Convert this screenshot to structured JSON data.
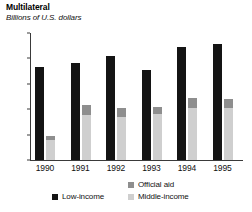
{
  "header": {
    "title": "Multilateral",
    "subtitle": "Billions of U.S. dollars"
  },
  "legend": {
    "official_aid": "Official aid",
    "low_income": "Low-income",
    "middle_income": "Middle-income"
  },
  "colors": {
    "low_income": "#141414",
    "official_aid": "#8e8e8e",
    "middle_income": "#cfcfcf",
    "axis": "#3a3a3a",
    "background": "#ffffff"
  },
  "axis": {
    "y_ticks": [
      "0",
      "3",
      "6",
      "9",
      "12",
      "15"
    ],
    "x_ticks": [
      "1990",
      "1991",
      "1992",
      "1993",
      "1994",
      "1995"
    ]
  },
  "chart_data": {
    "type": "bar",
    "title": "Multilateral",
    "subtitle": "Billions of U.S. dollars",
    "xlabel": "",
    "ylabel": "Billions of U.S. dollars",
    "ylim": [
      0,
      15
    ],
    "yticks": [
      0,
      3,
      6,
      9,
      12,
      15
    ],
    "grid": false,
    "legend_position": "bottom-right",
    "categories": [
      "1990",
      "1991",
      "1992",
      "1993",
      "1994",
      "1995"
    ],
    "series": [
      {
        "name": "Low-income",
        "color": "#141414",
        "stacked": false,
        "values": [
          11.0,
          11.5,
          12.3,
          10.6,
          13.4,
          13.7
        ]
      },
      {
        "name": "Middle-income",
        "color": "#cfcfcf",
        "stacked": true,
        "stack_group": "aid-stack",
        "values": [
          2.4,
          5.3,
          5.1,
          5.4,
          6.1,
          6.1
        ]
      },
      {
        "name": "Official aid",
        "color": "#8e8e8e",
        "stacked": true,
        "stack_group": "aid-stack",
        "values": [
          0.4,
          1.2,
          1.1,
          0.9,
          1.2,
          1.1
        ]
      }
    ],
    "stack_totals": [
      2.8,
      6.5,
      6.2,
      6.3,
      7.3,
      7.2
    ]
  }
}
